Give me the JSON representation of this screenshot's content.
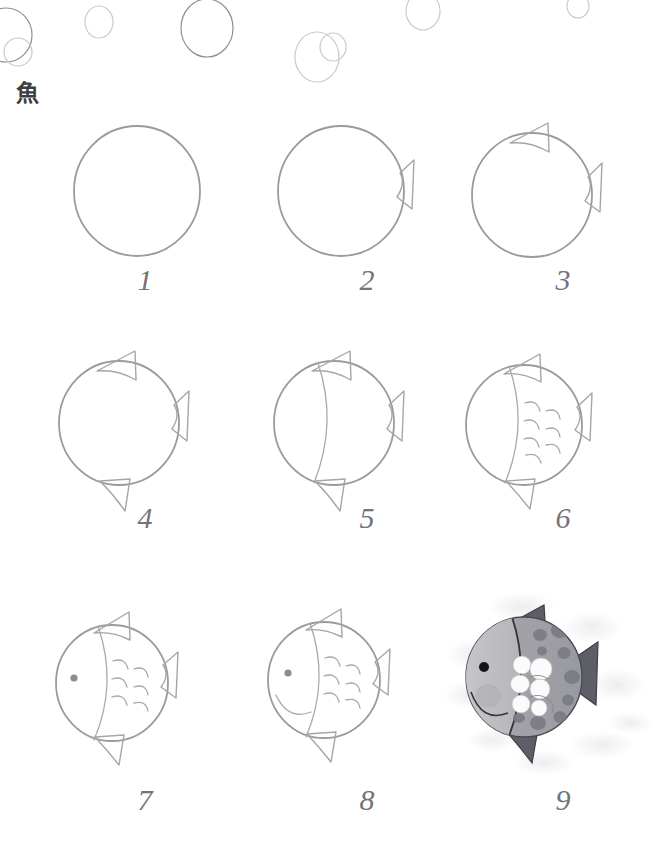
{
  "page": {
    "title_kanji": "魚",
    "background_color": "#ffffff",
    "pencil_color": "#9a9aa0",
    "number_color": "#73737a",
    "width": 666,
    "height": 863
  },
  "decorations": {
    "bubbles_label": "bubble-outline",
    "bubbles": [
      {
        "cx": 6,
        "cy": 35,
        "rx": 26,
        "ry": 27,
        "tone": "dark"
      },
      {
        "cx": 18,
        "cy": 52,
        "rx": 14,
        "ry": 14,
        "tone": "light"
      },
      {
        "cx": 99,
        "cy": 22,
        "rx": 14,
        "ry": 16,
        "tone": "light"
      },
      {
        "cx": 207,
        "cy": 28,
        "rx": 26,
        "ry": 29,
        "tone": "dark"
      },
      {
        "cx": 317,
        "cy": 57,
        "rx": 22,
        "ry": 25,
        "tone": "light"
      },
      {
        "cx": 333,
        "cy": 47,
        "rx": 13,
        "ry": 14,
        "tone": "light"
      },
      {
        "cx": 423,
        "cy": 11,
        "rx": 17,
        "ry": 19,
        "tone": "light"
      },
      {
        "cx": 578,
        "cy": 6,
        "rx": 11,
        "ry": 12,
        "tone": "light"
      }
    ]
  },
  "steps": [
    {
      "number": "1",
      "name": "step-1-circle",
      "description": "Draw a circle for the fish body",
      "features": [
        "body-circle"
      ]
    },
    {
      "number": "2",
      "name": "step-2-tail",
      "description": "Add the tail fin on the right",
      "features": [
        "body-circle",
        "tail-fin"
      ]
    },
    {
      "number": "3",
      "name": "step-3-dorsal-fin",
      "description": "Add the dorsal fin on top",
      "features": [
        "body-circle",
        "tail-fin",
        "dorsal-fin"
      ]
    },
    {
      "number": "4",
      "name": "step-4-bottom-fin",
      "description": "Add the bottom fin",
      "features": [
        "body-circle",
        "tail-fin",
        "dorsal-fin",
        "bottom-fin"
      ]
    },
    {
      "number": "5",
      "name": "step-5-head-line",
      "description": "Draw the curved head dividing line",
      "features": [
        "body-circle",
        "tail-fin",
        "dorsal-fin",
        "bottom-fin",
        "head-line"
      ]
    },
    {
      "number": "6",
      "name": "step-6-scales",
      "description": "Add the scales",
      "features": [
        "body-circle",
        "tail-fin",
        "dorsal-fin",
        "bottom-fin",
        "head-line",
        "scales"
      ]
    },
    {
      "number": "7",
      "name": "step-7-eye",
      "description": "Add the eye",
      "features": [
        "body-circle",
        "tail-fin",
        "dorsal-fin",
        "bottom-fin",
        "head-line",
        "scales",
        "eye"
      ]
    },
    {
      "number": "8",
      "name": "step-8-mouth",
      "description": "Add the mouth",
      "features": [
        "body-circle",
        "tail-fin",
        "dorsal-fin",
        "bottom-fin",
        "head-line",
        "scales",
        "eye",
        "mouth"
      ]
    },
    {
      "number": "9",
      "name": "step-9-colored",
      "description": "Shade and color the finished fish",
      "features": [
        "colored-finished-fish",
        "watercolor-background",
        "spots",
        "white-scales",
        "dark-fins"
      ]
    }
  ],
  "colors": {
    "pencil_line": "#9a9aa0",
    "bubble_light": "#c9c9d0",
    "bubble_dark": "#8f8f98",
    "number_text": "#73737a",
    "kanji_text": "#3e3e42",
    "fish_head_gray": "#bfbfc2",
    "fish_body_gray": "#a3a3a8",
    "fish_spot_gray": "#7f7f86",
    "fish_fin_dark": "#5e5e66",
    "fish_scale_white": "#fbfbfb",
    "fish_eye_black": "#1a1a1a",
    "watercolor_wash": "#d8d8dc"
  }
}
